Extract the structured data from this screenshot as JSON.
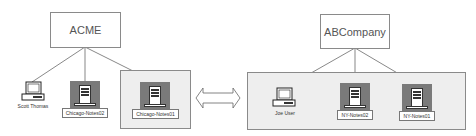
{
  "diagram": {
    "left_org": {
      "title": "ACME",
      "nodes": [
        {
          "type": "workstation",
          "label": "Scott Thomas"
        },
        {
          "type": "server",
          "label": "Chicago-Notes02"
        },
        {
          "type": "server",
          "label": "Chicago-Notes01",
          "grouped": true
        }
      ]
    },
    "right_org": {
      "title": "ABCompany",
      "nodes": [
        {
          "type": "workstation",
          "label": "Joe User"
        },
        {
          "type": "server",
          "label": "NY-Notes02"
        },
        {
          "type": "server",
          "label": "NY-Notes01"
        }
      ]
    },
    "connector": {
      "type": "double-arrow",
      "meaning": "bidirectional"
    },
    "colors": {
      "container_fill": "#eeeeee",
      "server_fill": "#7a7a7a",
      "border": "#8a8a8a",
      "line": "#555555"
    }
  }
}
